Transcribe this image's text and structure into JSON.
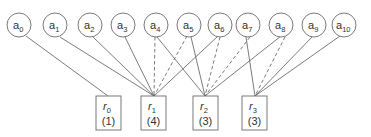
{
  "diagram": {
    "type": "bipartite-graph",
    "top_nodes": [
      {
        "id": "a0",
        "base": "a",
        "sub": "0",
        "cx": 19
      },
      {
        "id": "a1",
        "base": "a",
        "sub": "1",
        "cx": 55
      },
      {
        "id": "a2",
        "base": "a",
        "sub": "2",
        "cx": 90
      },
      {
        "id": "a3",
        "base": "a",
        "sub": "3",
        "cx": 123
      },
      {
        "id": "a4",
        "base": "a",
        "sub": "4",
        "cx": 155
      },
      {
        "id": "a5",
        "base": "a",
        "sub": "5",
        "cx": 190
      },
      {
        "id": "a6",
        "base": "a",
        "sub": "6",
        "cx": 221
      },
      {
        "id": "a7",
        "base": "a",
        "sub": "7",
        "cx": 253
      },
      {
        "id": "a8",
        "base": "a",
        "sub": "8",
        "cx": 285
      },
      {
        "id": "a9",
        "base": "a",
        "sub": "9",
        "cx": 316
      },
      {
        "id": "a10",
        "base": "a",
        "sub": "10",
        "cx": 344
      }
    ],
    "bottom_nodes": [
      {
        "id": "r0",
        "base": "r",
        "sub": "0",
        "count": "(1)",
        "cx": 108
      },
      {
        "id": "r1",
        "base": "r",
        "sub": "1",
        "count": "(4)",
        "cx": 154
      },
      {
        "id": "r2",
        "base": "r",
        "sub": "2",
        "count": "(3)",
        "cx": 205
      },
      {
        "id": "r3",
        "base": "r",
        "sub": "3",
        "count": "(3)",
        "cx": 255
      }
    ],
    "edges": [
      {
        "from": "a0",
        "to": "r0",
        "style": "solid"
      },
      {
        "from": "a1",
        "to": "r1",
        "style": "solid"
      },
      {
        "from": "a2",
        "to": "r1",
        "style": "solid"
      },
      {
        "from": "a3",
        "to": "r1",
        "style": "solid"
      },
      {
        "from": "a4",
        "to": "r1",
        "style": "dashed"
      },
      {
        "from": "a5",
        "to": "r1",
        "style": "dashed"
      },
      {
        "from": "a6",
        "to": "r1",
        "style": "solid"
      },
      {
        "from": "a4",
        "to": "r2",
        "style": "solid"
      },
      {
        "from": "a5",
        "to": "r2",
        "style": "solid"
      },
      {
        "from": "a6",
        "to": "r2",
        "style": "dashed"
      },
      {
        "from": "a7",
        "to": "r2",
        "style": "dashed"
      },
      {
        "from": "a8",
        "to": "r2",
        "style": "solid"
      },
      {
        "from": "a7",
        "to": "r3",
        "style": "solid"
      },
      {
        "from": "a8",
        "to": "r3",
        "style": "dashed"
      },
      {
        "from": "a9",
        "to": "r3",
        "style": "solid"
      },
      {
        "from": "a10",
        "to": "r3",
        "style": "solid"
      }
    ]
  },
  "labels": {
    "a0": "a",
    "a0_sub": "0",
    "a1": "a",
    "a1_sub": "1",
    "a2": "a",
    "a2_sub": "2",
    "a3": "a",
    "a3_sub": "3",
    "a4": "a",
    "a4_sub": "4",
    "a5": "a",
    "a5_sub": "5",
    "a6": "a",
    "a6_sub": "6",
    "a7": "a",
    "a7_sub": "7",
    "a8": "a",
    "a8_sub": "8",
    "a9": "a",
    "a9_sub": "9",
    "a10": "a",
    "a10_sub": "10",
    "r0": "r",
    "r0_sub": "0",
    "r0_count": "(1)",
    "r1": "r",
    "r1_sub": "1",
    "r1_count": "(4)",
    "r2": "r",
    "r2_sub": "2",
    "r2_count": "(3)",
    "r3": "r",
    "r3_sub": "3",
    "r3_count": "(3)"
  }
}
